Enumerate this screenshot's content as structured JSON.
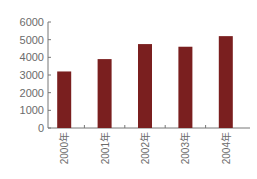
{
  "chart_data": {
    "type": "bar",
    "title": "",
    "xlabel": "",
    "ylabel": "",
    "categories": [
      "2000年",
      "2001年",
      "2002年",
      "2003年",
      "2004年"
    ],
    "values": [
      3200,
      3900,
      4750,
      4600,
      5200
    ],
    "ylim": [
      0,
      6000
    ],
    "yticks": [
      0,
      1000,
      2000,
      3000,
      4000,
      5000,
      6000
    ],
    "ytick_labels": [
      "0",
      "1000",
      "2000",
      "3000",
      "4000",
      "5000",
      "6000"
    ],
    "grid": false,
    "legend": null,
    "bar_color": "#7a1f1f",
    "axis_color": "#777777",
    "x_label_rotation": -90
  }
}
